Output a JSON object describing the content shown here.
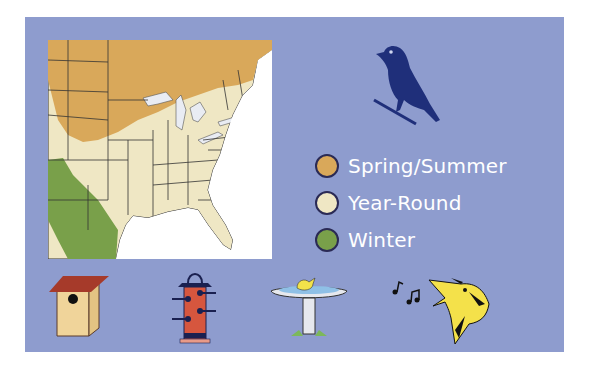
{
  "legend": {
    "items": [
      {
        "label": "Spring/Summer",
        "color": "#d9a85a"
      },
      {
        "label": "Year-Round",
        "color": "#efe7c4"
      },
      {
        "label": "Winter",
        "color": "#79a04a"
      }
    ]
  },
  "colors": {
    "panel": "#8e9cce",
    "bird_silhouette": "#1f2f7a"
  },
  "icons": [
    "birdhouse-icon",
    "bird-feeder-icon",
    "birdbath-icon",
    "singing-bird-icon"
  ]
}
